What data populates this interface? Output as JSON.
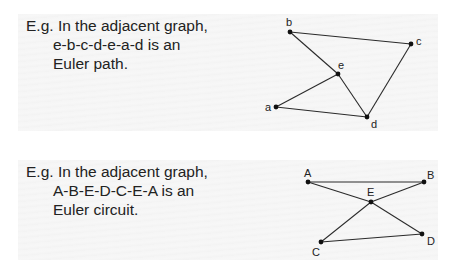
{
  "examples": [
    {
      "caption": {
        "prefix": "E.g.",
        "line1": "In the adjacent graph,",
        "line2": "e-b-c-d-e-a-d is an",
        "line3": "Euler path."
      },
      "graph": {
        "nodes": [
          {
            "id": "b",
            "label": "b",
            "x": 290,
            "y": 32,
            "lx": 286,
            "ly": 26
          },
          {
            "id": "c",
            "label": "c",
            "x": 411,
            "y": 44,
            "lx": 416,
            "ly": 45
          },
          {
            "id": "e",
            "label": "e",
            "x": 338,
            "y": 74,
            "lx": 338,
            "ly": 69
          },
          {
            "id": "a",
            "label": "a",
            "x": 276,
            "y": 107,
            "lx": 265,
            "ly": 111
          },
          {
            "id": "d",
            "label": "d",
            "x": 367,
            "y": 117,
            "lx": 371,
            "ly": 128
          }
        ],
        "edges": [
          [
            "b",
            "c"
          ],
          [
            "b",
            "e"
          ],
          [
            "c",
            "d"
          ],
          [
            "e",
            "d"
          ],
          [
            "e",
            "a"
          ],
          [
            "a",
            "d"
          ]
        ]
      }
    },
    {
      "caption": {
        "prefix": "E.g.",
        "line1": "In the adjacent graph,",
        "line2": "A-B-E-D-C-E-A is an",
        "line3": "Euler circuit."
      },
      "graph": {
        "nodes": [
          {
            "id": "A",
            "label": "A",
            "x": 308,
            "y": 182,
            "lx": 304,
            "ly": 177
          },
          {
            "id": "B",
            "label": "B",
            "x": 424,
            "y": 182,
            "lx": 427,
            "ly": 179
          },
          {
            "id": "E",
            "label": "E",
            "x": 371,
            "y": 202,
            "lx": 367,
            "ly": 196
          },
          {
            "id": "C",
            "label": "C",
            "x": 321,
            "y": 242,
            "lx": 312,
            "ly": 256
          },
          {
            "id": "D",
            "label": "D",
            "x": 422,
            "y": 234,
            "lx": 427,
            "ly": 245
          }
        ],
        "edges": [
          [
            "A",
            "B"
          ],
          [
            "A",
            "E"
          ],
          [
            "B",
            "E"
          ],
          [
            "E",
            "C"
          ],
          [
            "E",
            "D"
          ],
          [
            "C",
            "D"
          ]
        ]
      }
    }
  ],
  "colors": {
    "edge": "#2a2a2a",
    "node": "#111111",
    "text": "#222222"
  }
}
